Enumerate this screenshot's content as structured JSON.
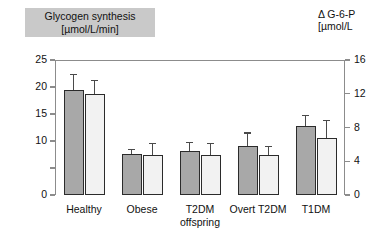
{
  "left_title": {
    "line1": "Glycogen synthesis",
    "line2": "[µmol/L/min]"
  },
  "right_title": {
    "line1": "Δ G-6-P",
    "line2": "[µmol/L"
  },
  "colors": {
    "title_box_bg": "#c9c9c9",
    "dark_bar": "#a8a8a8",
    "light_bar": "#f2f2f2",
    "bar_border": "#2b2b2b",
    "axis": "#8c8c8c",
    "text": "#111111"
  },
  "chart_data": {
    "type": "bar",
    "title": "Glycogen synthesis [µmol/L/min]",
    "subtitle": "Δ G-6-P [µmol/L",
    "xlabel": "",
    "ylabel": "Glycogen synthesis [µmol/L/min]",
    "y2label": "Δ G-6-P [µmol/L",
    "grid": false,
    "legend": "none",
    "ylim": [
      0,
      25
    ],
    "y2lim": [
      0,
      16
    ],
    "yticks": [
      0,
      5,
      10,
      15,
      20,
      25
    ],
    "ytick_labels": [
      "0",
      "",
      "10",
      "15",
      "20",
      "25"
    ],
    "y2ticks": [
      0,
      4,
      8,
      12,
      16
    ],
    "y2tick_labels": [
      "0",
      "4",
      "8",
      "12",
      "16"
    ],
    "categories": [
      "Healthy",
      "Obese",
      "T2DM offspring",
      "Overt T2DM",
      "T1DM"
    ],
    "category_lines": [
      [
        "Healthy"
      ],
      [
        "Obese"
      ],
      [
        "T2DM",
        "offspring"
      ],
      [
        "Overt T2DM"
      ],
      [
        "T1DM"
      ]
    ],
    "series": [
      {
        "name": "Glycogen synthesis",
        "axis": "left",
        "fill": "#a8a8a8",
        "values": [
          19.5,
          7.6,
          8.2,
          9.0,
          12.7
        ],
        "errors": [
          3.0,
          0.9,
          1.7,
          2.6,
          2.2
        ]
      },
      {
        "name": "Δ G-6-P",
        "axis": "right",
        "fill": "#f2f2f2",
        "values": [
          12.0,
          4.8,
          4.7,
          4.7,
          6.8
        ],
        "errors": [
          1.6,
          1.4,
          1.5,
          1.1,
          2.1
        ]
      }
    ]
  }
}
